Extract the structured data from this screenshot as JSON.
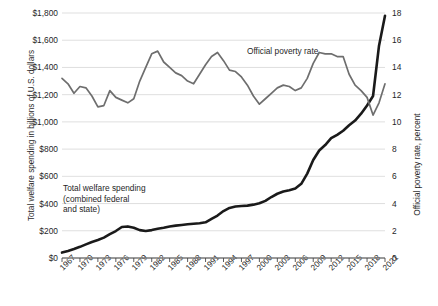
{
  "chart_data": {
    "type": "line",
    "title": "",
    "xlabel": "",
    "ylabel": "Total welfare spending in billions of U.S. dollars",
    "y2label": "Official poverty rate, percent",
    "grid": true,
    "legend": "annotations",
    "ylim": [
      0,
      1800
    ],
    "y2lim": [
      0,
      18
    ],
    "yticks": [
      "$0",
      "$200",
      "$400",
      "$600",
      "$800",
      "$1,000",
      "$1,200",
      "$1,400",
      "$1,600",
      "$1,800"
    ],
    "ytick_values": [
      0,
      200,
      400,
      600,
      800,
      1000,
      1200,
      1400,
      1600,
      1800
    ],
    "y2ticks": [
      "0",
      "2",
      "4",
      "6",
      "8",
      "10",
      "12",
      "14",
      "16",
      "18"
    ],
    "y2tick_values": [
      0,
      2,
      4,
      6,
      8,
      10,
      12,
      14,
      16,
      18
    ],
    "xticks": [
      "1967",
      "1970",
      "1973",
      "1976",
      "1979",
      "1982",
      "1985",
      "1988",
      "1991",
      "1994",
      "1997",
      "2000",
      "2003",
      "2006",
      "2009",
      "2012",
      "2015",
      "2018",
      "2021"
    ],
    "x": [
      1967,
      1968,
      1969,
      1970,
      1971,
      1972,
      1973,
      1974,
      1975,
      1976,
      1977,
      1978,
      1979,
      1980,
      1981,
      1982,
      1983,
      1984,
      1985,
      1986,
      1987,
      1988,
      1989,
      1990,
      1991,
      1992,
      1993,
      1994,
      1995,
      1996,
      1997,
      1998,
      1999,
      2000,
      2001,
      2002,
      2003,
      2004,
      2005,
      2006,
      2007,
      2008,
      2009,
      2010,
      2011,
      2012,
      2013,
      2014,
      2015,
      2016,
      2017,
      2018,
      2019,
      2020,
      2021
    ],
    "series": [
      {
        "name": "Total welfare spending (combined federal and state)",
        "axis": "left",
        "color": "#1a1a1a",
        "units": "billions of U.S. dollars",
        "values": [
          40,
          52,
          66,
          82,
          100,
          118,
          132,
          150,
          175,
          198,
          228,
          232,
          222,
          205,
          198,
          205,
          215,
          222,
          232,
          238,
          243,
          248,
          252,
          255,
          262,
          288,
          312,
          345,
          368,
          378,
          382,
          385,
          392,
          402,
          420,
          448,
          472,
          488,
          498,
          510,
          545,
          620,
          720,
          790,
          830,
          880,
          905,
          935,
          975,
          1010,
          1060,
          1120,
          1190,
          1560,
          1780
        ]
      },
      {
        "name": "Official poverty rate",
        "axis": "right",
        "color": "#6e6e6e",
        "units": "percent",
        "values": [
          13.2,
          12.8,
          12.1,
          12.6,
          12.5,
          11.9,
          11.1,
          11.2,
          12.3,
          11.8,
          11.6,
          11.4,
          11.7,
          13.0,
          14.0,
          15.0,
          15.2,
          14.4,
          14.0,
          13.6,
          13.4,
          13.0,
          12.8,
          13.5,
          14.2,
          14.8,
          15.1,
          14.5,
          13.8,
          13.7,
          13.3,
          12.7,
          11.9,
          11.3,
          11.7,
          12.1,
          12.5,
          12.7,
          12.6,
          12.3,
          12.5,
          13.2,
          14.3,
          15.1,
          15.0,
          15.0,
          14.8,
          14.8,
          13.5,
          12.7,
          12.3,
          11.8,
          10.5,
          11.4,
          12.8
        ]
      }
    ],
    "annotations": [
      {
        "name": "spending-annotation",
        "text": "Total welfare spending\n(combined federal\nand state)"
      },
      {
        "name": "poverty-annotation",
        "text": "Official poverty rate"
      }
    ]
  }
}
